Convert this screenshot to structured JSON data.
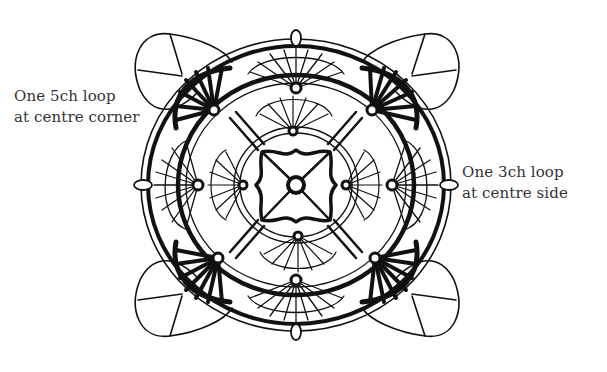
{
  "diagram": {
    "type": "crochet-motif-chart",
    "colors": {
      "ink": "#111111",
      "paper": "#ffffff",
      "label_text": "#333333"
    }
  },
  "labels": {
    "corner": {
      "line1": "One 5ch loop",
      "line2": "at centre corner"
    },
    "side": {
      "line1": "One 3ch loop",
      "line2": "at centre side"
    }
  }
}
